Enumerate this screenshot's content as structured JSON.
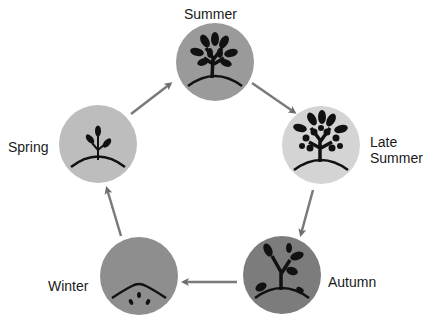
{
  "diagram": {
    "type": "cycle",
    "nodes": [
      {
        "id": "summer",
        "label": "Summer",
        "fill": "#9a9a9a",
        "icon": "full-leafed-tree-icon"
      },
      {
        "id": "late_summer",
        "label_line1": "Late",
        "label_line2": "Summer",
        "fill": "#d4d4d4",
        "icon": "fruiting-tree-icon"
      },
      {
        "id": "autumn",
        "label": "Autumn",
        "fill": "#7c7c7c",
        "icon": "falling-leaves-tree-icon"
      },
      {
        "id": "winter",
        "label": "Winter",
        "fill": "#8e8e8e",
        "icon": "seeds-underground-icon"
      },
      {
        "id": "spring",
        "label": "Spring",
        "fill": "#bdbdbd",
        "icon": "sprout-icon"
      }
    ],
    "edges": [
      {
        "from": "spring",
        "to": "summer"
      },
      {
        "from": "summer",
        "to": "late_summer"
      },
      {
        "from": "late_summer",
        "to": "autumn"
      },
      {
        "from": "autumn",
        "to": "winter"
      },
      {
        "from": "winter",
        "to": "spring"
      }
    ],
    "arrow_color": "#7a7a7a",
    "icon_color": "#111111"
  }
}
